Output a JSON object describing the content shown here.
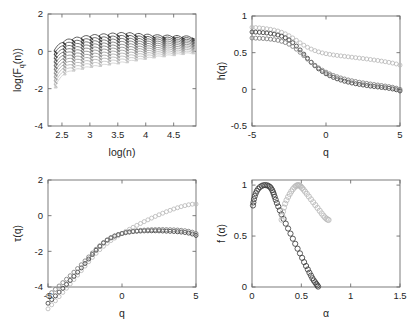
{
  "figure": {
    "title": "",
    "background": "#ffffff",
    "series_colors": {
      "dark": "#3d3d3d",
      "light": "#b9b9b9",
      "mid": "#808080"
    }
  },
  "panels": [
    {
      "id": "fq",
      "name": "fluctuation-function-panel",
      "xlabel": "log(n)",
      "ylabel_main": "log(F",
      "ylabel_sub": "q",
      "ylabel_tail": "(n))",
      "xlim": [
        2.25,
        4.9
      ],
      "ylim": [
        -4,
        2
      ],
      "xticks": [
        2.5,
        3,
        3.5,
        4,
        4.5
      ],
      "xticklabels": [
        "2.5",
        "3",
        "3.5",
        "4",
        "4.5"
      ],
      "yticks": [
        -4,
        -2,
        0,
        2
      ],
      "yticklabels": [
        "-4",
        "-2",
        "0",
        "2"
      ]
    },
    {
      "id": "hq",
      "name": "generalized-hurst-panel",
      "xlabel": "q",
      "ylabel": "h(q)",
      "xlim": [
        -5,
        5
      ],
      "ylim": [
        -0.5,
        1
      ],
      "xticks": [
        -5,
        0,
        5
      ],
      "xticklabels": [
        "-5",
        "0",
        "5"
      ],
      "yticks": [
        -0.5,
        0,
        0.5,
        1
      ],
      "yticklabels": [
        "-0.5",
        "0",
        "0.5",
        "1"
      ]
    },
    {
      "id": "tq",
      "name": "mass-exponent-panel",
      "xlabel": "q",
      "ylabel": "τ(q)",
      "xlim": [
        -5,
        5
      ],
      "ylim": [
        -4,
        2
      ],
      "xticks": [
        -5,
        0,
        5
      ],
      "xticklabels": [
        "-5",
        "0",
        "5"
      ],
      "yticks": [
        -4,
        -2,
        0,
        2
      ],
      "yticklabels": [
        "-4",
        "-2",
        "0",
        "2"
      ]
    },
    {
      "id": "fa",
      "name": "singularity-spectrum-panel",
      "xlabel": "α",
      "ylabel": "f (α)",
      "xlim": [
        0,
        1.5
      ],
      "ylim": [
        0,
        1.05
      ],
      "xticks": [
        0,
        0.5,
        1,
        1.5
      ],
      "xticklabels": [
        "0",
        "0.5",
        "1",
        "1.5"
      ],
      "yticks": [
        0,
        0.5,
        1
      ],
      "yticklabels": [
        "0",
        "0.5",
        "1"
      ]
    }
  ],
  "chart_data": [
    {
      "type": "line",
      "panel": "fq",
      "title": "",
      "xlabel": "log(n)",
      "ylabel": "log(F_q(n))",
      "xlim": [
        2.25,
        4.9
      ],
      "ylim": [
        -4,
        2
      ],
      "grid": false,
      "legend": "none",
      "description": "Log-log fluctuation functions F_q(n) for many q orders, forming rising comb-like bundles",
      "n_bundles": 16,
      "bundle_x": [
        2.36,
        2.52,
        2.68,
        2.84,
        3.0,
        3.16,
        3.32,
        3.48,
        3.64,
        3.8,
        3.96,
        4.12,
        4.3,
        4.48,
        4.64,
        4.82
      ],
      "bundle_top": [
        0.05,
        0.48,
        0.62,
        0.7,
        0.78,
        0.82,
        0.86,
        0.9,
        0.92,
        0.88,
        0.84,
        0.8,
        0.78,
        0.76,
        0.74,
        0.72
      ],
      "bundle_bottom": [
        -1.95,
        -1.25,
        -1.05,
        -0.95,
        -0.85,
        -0.8,
        -0.72,
        -0.66,
        -0.6,
        -0.5,
        -0.42,
        -0.34,
        -0.28,
        -0.22,
        -0.16,
        -0.12
      ],
      "curves_per_bundle": 11
    },
    {
      "type": "scatter",
      "panel": "hq",
      "title": "",
      "xlabel": "q",
      "ylabel": "h(q)",
      "xlim": [
        -5,
        5
      ],
      "ylim": [
        -0.5,
        1
      ],
      "grid": false,
      "legend": "none",
      "x": [
        -5,
        -4.75,
        -4.5,
        -4.25,
        -4,
        -3.75,
        -3.5,
        -3.25,
        -3,
        -2.75,
        -2.5,
        -2.25,
        -2,
        -1.75,
        -1.5,
        -1.25,
        -1,
        -0.75,
        -0.5,
        -0.25,
        0,
        0.25,
        0.5,
        0.75,
        1,
        1.25,
        1.5,
        1.75,
        2,
        2.25,
        2.5,
        2.75,
        3,
        3.25,
        3.5,
        3.75,
        4,
        4.25,
        4.5,
        4.75,
        5
      ],
      "series": [
        {
          "name": "series-light",
          "color": "#b9b9b9",
          "values": [
            0.845,
            0.842,
            0.838,
            0.833,
            0.826,
            0.818,
            0.808,
            0.795,
            0.778,
            0.757,
            0.731,
            0.701,
            0.668,
            0.634,
            0.602,
            0.573,
            0.549,
            0.528,
            0.511,
            0.497,
            0.486,
            0.477,
            0.469,
            0.462,
            0.456,
            0.45,
            0.444,
            0.438,
            0.432,
            0.426,
            0.42,
            0.414,
            0.407,
            0.4,
            0.393,
            0.385,
            0.377,
            0.368,
            0.358,
            0.346,
            0.33
          ]
        },
        {
          "name": "series-dark",
          "color": "#3d3d3d",
          "values": [
            0.782,
            0.78,
            0.777,
            0.773,
            0.768,
            0.761,
            0.752,
            0.74,
            0.724,
            0.702,
            0.673,
            0.636,
            0.59,
            0.537,
            0.48,
            0.423,
            0.369,
            0.321,
            0.279,
            0.243,
            0.212,
            0.186,
            0.163,
            0.143,
            0.126,
            0.111,
            0.098,
            0.086,
            0.076,
            0.067,
            0.059,
            0.051,
            0.044,
            0.038,
            0.032,
            0.026,
            0.02,
            0.013,
            0.005,
            -0.006,
            -0.022
          ]
        },
        {
          "name": "series-mid",
          "color": "#7d7d7d",
          "values": [
            0.7,
            0.698,
            0.696,
            0.693,
            0.689,
            0.684,
            0.677,
            0.668,
            0.655,
            0.638,
            0.615,
            0.585,
            0.548,
            0.505,
            0.459,
            0.412,
            0.368,
            0.328,
            0.292,
            0.261,
            0.234,
            0.21,
            0.189,
            0.171,
            0.155,
            0.141,
            0.128,
            0.117,
            0.107,
            0.097,
            0.089,
            0.081,
            0.073,
            0.066,
            0.059,
            0.052,
            0.045,
            0.037,
            0.028,
            0.016,
            0.0
          ]
        }
      ]
    },
    {
      "type": "scatter",
      "panel": "tq",
      "title": "",
      "xlabel": "q",
      "ylabel": "τ(q)",
      "xlim": [
        -5,
        5
      ],
      "ylim": [
        -4,
        2
      ],
      "grid": false,
      "legend": "none",
      "x": [
        -5,
        -4.75,
        -4.5,
        -4.25,
        -4,
        -3.75,
        -3.5,
        -3.25,
        -3,
        -2.75,
        -2.5,
        -2.25,
        -2,
        -1.75,
        -1.5,
        -1.25,
        -1,
        -0.75,
        -0.5,
        -0.25,
        0,
        0.25,
        0.5,
        0.75,
        1,
        1.25,
        1.5,
        1.75,
        2,
        2.25,
        2.5,
        2.75,
        3,
        3.25,
        3.5,
        3.75,
        4,
        4.25,
        4.5,
        4.75,
        5
      ],
      "series": [
        {
          "name": "series-light",
          "color": "#b9b9b9",
          "values": [
            -3.8,
            -3.62,
            -3.43,
            -3.24,
            -3.05,
            -3.0,
            -2.83,
            -2.59,
            -2.33,
            -2.08,
            -1.83,
            -1.58,
            -1.34,
            -1.11,
            -0.9,
            -0.72,
            -0.55,
            -0.4,
            -0.26,
            -0.12,
            -1.0,
            -0.88,
            -0.77,
            -0.65,
            -0.54,
            -0.44,
            -0.33,
            -0.23,
            -0.14,
            -0.04,
            0.05,
            0.14,
            0.22,
            0.3,
            0.38,
            0.44,
            0.51,
            0.56,
            0.61,
            0.64,
            0.65
          ]
        },
        {
          "name": "series-dark",
          "color": "#3d3d3d",
          "values": [
            -4.0,
            -3.78,
            -3.55,
            -3.34,
            -3.12,
            -2.91,
            -2.7,
            -2.5,
            -2.3,
            -2.1,
            -1.91,
            -1.73,
            -1.55,
            -1.38,
            -1.22,
            -1.07,
            -0.94,
            -0.82,
            -0.72,
            -0.63,
            -1.0,
            -0.95,
            -0.92,
            -0.89,
            -0.87,
            -0.86,
            -0.85,
            -0.85,
            -0.85,
            -0.85,
            -0.85,
            -0.86,
            -0.87,
            -0.88,
            -0.89,
            -0.9,
            -0.92,
            -0.94,
            -0.98,
            -1.02,
            -1.11
          ]
        }
      ],
      "note": "tau(q) = q*h(q) - 1"
    },
    {
      "type": "scatter",
      "panel": "fa",
      "title": "",
      "xlabel": "α",
      "ylabel": "f (α)",
      "xlim": [
        0,
        1.5
      ],
      "ylim": [
        0,
        1.05
      ],
      "grid": false,
      "legend": "none",
      "series": [
        {
          "name": "spectrum-dark",
          "color": "#3d3d3d",
          "alpha": [
            0.01,
            0.014,
            0.02,
            0.028,
            0.038,
            0.05,
            0.064,
            0.08,
            0.098,
            0.116,
            0.134,
            0.152,
            0.168,
            0.182,
            0.194,
            0.205,
            0.214,
            0.222,
            0.23,
            0.24,
            0.252,
            0.266,
            0.282,
            0.3,
            0.32,
            0.342,
            0.366,
            0.39,
            0.414,
            0.438,
            0.462,
            0.486,
            0.508,
            0.528,
            0.548,
            0.566,
            0.582,
            0.598,
            0.612,
            0.626,
            0.64,
            0.652,
            0.662,
            0.67
          ],
          "f": [
            0.8,
            0.83,
            0.862,
            0.892,
            0.92,
            0.944,
            0.964,
            0.98,
            0.992,
            0.999,
            1.0,
            0.998,
            0.992,
            0.982,
            0.968,
            0.95,
            0.93,
            0.908,
            0.884,
            0.856,
            0.824,
            0.79,
            0.752,
            0.712,
            0.668,
            0.622,
            0.574,
            0.524,
            0.474,
            0.424,
            0.376,
            0.33,
            0.286,
            0.244,
            0.206,
            0.172,
            0.14,
            0.112,
            0.086,
            0.064,
            0.046,
            0.03,
            0.016,
            0.004
          ]
        },
        {
          "name": "spectrum-light",
          "color": "#b9b9b9",
          "alpha": [
            0.3,
            0.306,
            0.314,
            0.324,
            0.336,
            0.35,
            0.366,
            0.382,
            0.398,
            0.414,
            0.43,
            0.444,
            0.456,
            0.466,
            0.476,
            0.486,
            0.496,
            0.508,
            0.522,
            0.538,
            0.556,
            0.576,
            0.598,
            0.62,
            0.642,
            0.664,
            0.686,
            0.706,
            0.724,
            0.74,
            0.754,
            0.766,
            0.776
          ],
          "f": [
            0.66,
            0.7,
            0.74,
            0.78,
            0.818,
            0.852,
            0.884,
            0.912,
            0.938,
            0.96,
            0.978,
            0.99,
            0.997,
            1.0,
            0.998,
            0.993,
            0.984,
            0.972,
            0.956,
            0.936,
            0.914,
            0.888,
            0.86,
            0.832,
            0.804,
            0.776,
            0.748,
            0.722,
            0.7,
            0.682,
            0.67,
            0.662,
            0.658
          ]
        }
      ]
    }
  ]
}
